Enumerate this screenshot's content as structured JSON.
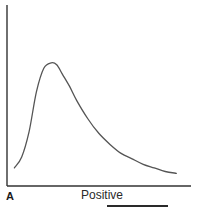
{
  "chart_data": {
    "type": "line",
    "title": "",
    "panel_label": "A",
    "xlabel": "Positive",
    "ylabel": "",
    "grid": false,
    "legend": null,
    "axis_ticks": false,
    "note": "No numeric ticks shown; values are normalized (0-100) estimates from pixel positions of a right-skewed single-peak curve.",
    "xlim": [
      0,
      100
    ],
    "ylim": [
      0,
      100
    ],
    "series": [
      {
        "name": "curve",
        "color": "#555555",
        "x": [
          4,
          8,
          12,
          16,
          20,
          24,
          27,
          30,
          34,
          38,
          44,
          50,
          56,
          62,
          68,
          74,
          80,
          86,
          92
        ],
        "y": [
          10,
          16,
          30,
          52,
          65,
          68,
          67,
          62,
          55,
          47,
          37,
          29,
          23,
          18,
          15,
          12,
          10,
          8,
          7
        ]
      }
    ]
  },
  "colors": {
    "axis": "#333333",
    "curve": "#555555",
    "background": "#ffffff"
  },
  "labels": {
    "panel": "A",
    "x_axis": "Positive"
  }
}
